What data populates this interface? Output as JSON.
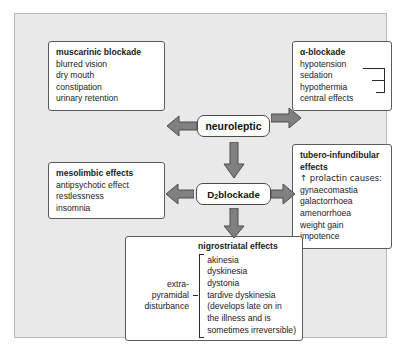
{
  "diagram": {
    "palette": {
      "panel_background": "#e9e9e9",
      "panel_border": "#b9b9b9",
      "box_background": "#ffffff",
      "box_border": "#5c5c5c",
      "arrow_fill": "#808080",
      "arrow_stroke": "#4d4d4d",
      "text": "#1a1a1a"
    },
    "nodes": {
      "neuroleptic": {
        "label": "neuroleptic"
      },
      "d2_blockade": {
        "label_pre": "D",
        "label_sub": "2",
        "label_post": " blockade"
      }
    },
    "boxes": {
      "muscarinic": {
        "heading": "muscarinic blockade",
        "items": [
          "blurred vision",
          "dry mouth",
          "constipation",
          "urinary retention"
        ]
      },
      "alpha": {
        "heading": "α-blockade",
        "items": [
          "hypotension",
          "sedation",
          "hypothermia",
          "central effects"
        ],
        "bracket_note": "sedation and hypothermia bracketed to central effects"
      },
      "mesolimbic": {
        "heading": "mesolimbic effects",
        "items": [
          "antipsychotic effect",
          "restlessness",
          "insomnia"
        ]
      },
      "tubero": {
        "heading_line1": "tubero-infundibular",
        "heading_line2": "effects",
        "prolactin_line": "↑ prolactin causes:",
        "items": [
          "gynaecomastia",
          "galactorrhoea",
          "amenorrhoea",
          "weight gain",
          "impotence"
        ]
      },
      "nigrostriatal": {
        "heading": "nigrostriatal effects",
        "left_label": [
          "extra-",
          "pyramidal",
          "disturbance"
        ],
        "items": [
          "akinesia",
          "dyskinesia",
          "dystonia",
          "tardive dyskinesia",
          "(develops late on in",
          "the illness and is",
          "sometimes irreversible)"
        ]
      }
    },
    "arrows": [
      {
        "name": "neuroleptic-to-muscarinic",
        "direction": "left"
      },
      {
        "name": "neuroleptic-to-alpha",
        "direction": "right"
      },
      {
        "name": "neuroleptic-to-d2",
        "direction": "down"
      },
      {
        "name": "d2-to-mesolimbic",
        "direction": "left"
      },
      {
        "name": "d2-to-tubero",
        "direction": "right"
      },
      {
        "name": "d2-to-nigrostriatal",
        "direction": "down"
      }
    ]
  }
}
